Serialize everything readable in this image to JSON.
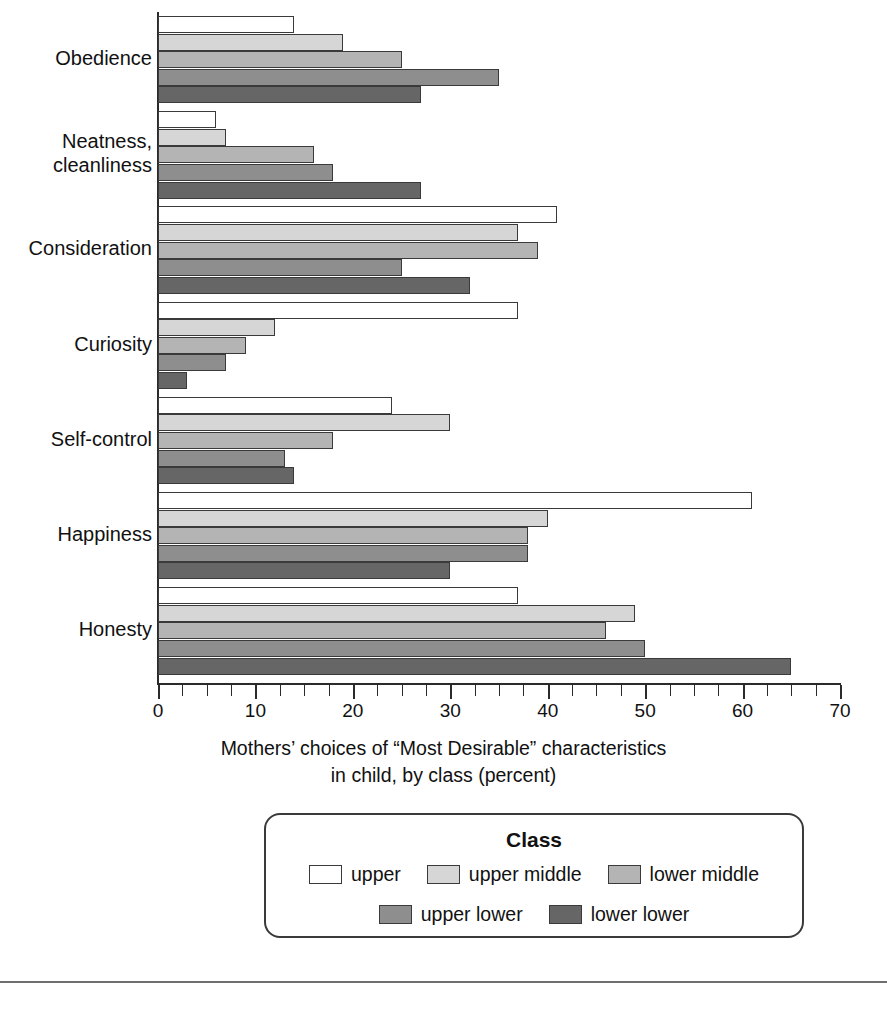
{
  "chart_data": {
    "type": "bar",
    "orientation": "horizontal",
    "title": "",
    "xlabel": "Mothers' choices of “Most Desirable” characteristics in child, by class (percent)",
    "xlabel_line1": "Mothers’ choices of “Most Desirable” characteristics",
    "xlabel_line2": "in child, by class (percent)",
    "ylabel": "",
    "xlim": [
      0,
      70
    ],
    "xticks": [
      0,
      10,
      20,
      30,
      40,
      50,
      60,
      70
    ],
    "xtick_labels": [
      "0",
      "10",
      "20",
      "30",
      "40",
      "50",
      "60",
      "70"
    ],
    "minor_tick_step": 2.5,
    "grid": false,
    "legend_position": "below-center",
    "legend_title": "Class",
    "categories": [
      "Obedience",
      "Neatness,\ncleanliness",
      "Consideration",
      "Curiosity",
      "Self-control",
      "Happiness",
      "Honesty"
    ],
    "series": [
      {
        "name": "upper",
        "color": "#ffffff",
        "values": [
          14,
          6,
          41,
          37,
          24,
          61,
          37
        ]
      },
      {
        "name": "upper middle",
        "color": "#d6d6d6",
        "values": [
          19,
          7,
          37,
          12,
          30,
          40,
          49
        ]
      },
      {
        "name": "lower middle",
        "color": "#b4b4b4",
        "values": [
          25,
          16,
          39,
          9,
          18,
          38,
          46
        ]
      },
      {
        "name": "upper lower",
        "color": "#8e8e8e",
        "values": [
          35,
          18,
          25,
          7,
          13,
          38,
          50
        ]
      },
      {
        "name": "lower lower",
        "color": "#666666",
        "values": [
          27,
          27,
          32,
          3,
          14,
          30,
          65
        ]
      }
    ]
  },
  "legend": {
    "title": "Class",
    "items": [
      {
        "label": "upper",
        "color": "#ffffff"
      },
      {
        "label": "upper middle",
        "color": "#d6d6d6"
      },
      {
        "label": "lower middle",
        "color": "#b4b4b4"
      },
      {
        "label": "upper lower",
        "color": "#8e8e8e"
      },
      {
        "label": "lower lower",
        "color": "#666666"
      }
    ]
  }
}
